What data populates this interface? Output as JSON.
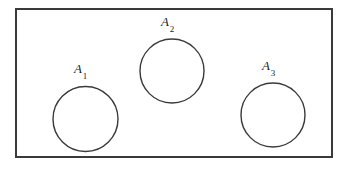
{
  "figure": {
    "type": "venn-diagram",
    "background_color": "#ffffff",
    "line_color": "#3a3a3c",
    "text_color": "#232326"
  },
  "universe": {
    "name": "universal-set-rectangle",
    "x": 15,
    "y": 8,
    "width": 318,
    "height": 150,
    "stroke_width": 2
  },
  "sets": [
    {
      "id": "A1",
      "label_base": "A",
      "label_sub": "1",
      "cx": 85.5,
      "cy": 119,
      "r": 32.5,
      "label_x": 74,
      "label_y": 62
    },
    {
      "id": "A2",
      "label_base": "A",
      "label_sub": "2",
      "cx": 172,
      "cy": 71,
      "r": 32,
      "label_x": 161,
      "label_y": 15
    },
    {
      "id": "A3",
      "label_base": "A",
      "label_sub": "3",
      "cx": 273,
      "cy": 115,
      "r": 32,
      "label_x": 262,
      "label_y": 59
    }
  ]
}
